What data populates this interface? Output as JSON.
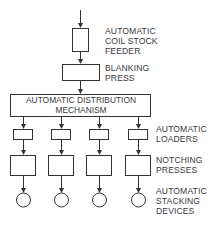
{
  "diagram": {
    "type": "flowchart",
    "nodes": {
      "feeder": {
        "label": "AUTOMATIC\nCOIL STOCK\nFEEDER"
      },
      "blanking": {
        "label": "BLANKING\nPRESS"
      },
      "distribution": {
        "line1": "AUTOMATIC DISTRIBUTION",
        "line2": "MECHANISM"
      },
      "loaders": {
        "label": "AUTOMATIC\nLOADERS",
        "count": 4
      },
      "notching": {
        "label": "NOTCHING\nPRESSES",
        "count": 4
      },
      "stacking": {
        "label": "AUTOMATIC\nSTACKING\nDEVICES",
        "count": 4
      }
    },
    "edges": [
      [
        "input",
        "feeder"
      ],
      [
        "feeder",
        "blanking"
      ],
      [
        "blanking",
        "distribution"
      ],
      [
        "distribution",
        "loaders"
      ],
      [
        "loaders",
        "notching"
      ],
      [
        "notching",
        "stacking"
      ]
    ],
    "colors": {
      "stroke": "#333333",
      "background": "#ffffff"
    }
  }
}
